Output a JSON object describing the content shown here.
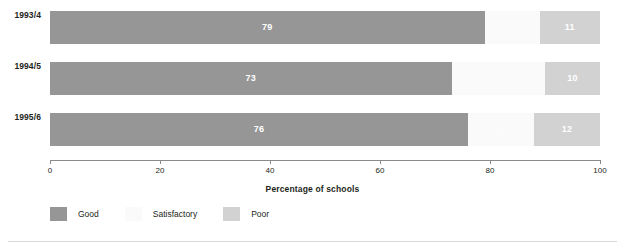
{
  "chart_data": {
    "type": "bar",
    "orientation": "horizontal",
    "stacked": true,
    "title": "",
    "xlabel": "Percentage of schools",
    "ylabel": "",
    "categories": [
      "1993/4",
      "1994/5",
      "1995/6"
    ],
    "series": [
      {
        "name": "Good",
        "color": "#969696",
        "values": [
          79,
          73,
          76
        ]
      },
      {
        "name": "Satisfactory",
        "color": "#fafafa",
        "values": [
          10,
          17,
          12
        ]
      },
      {
        "name": "Poor",
        "color": "#d2d2d2",
        "values": [
          11,
          10,
          12
        ]
      }
    ],
    "xlim": [
      0,
      100
    ],
    "xticks": [
      0,
      20,
      40,
      60,
      80,
      100
    ],
    "xtick_labels": [
      "0",
      "20",
      "40",
      "60",
      "80",
      "100"
    ],
    "grid": false,
    "legend_position": "bottom-left",
    "data_labels": true
  },
  "axis": {
    "title": "Percentage of schools",
    "ticks": [
      "0",
      "20",
      "40",
      "60",
      "80",
      "100"
    ]
  },
  "legend": {
    "items": [
      {
        "label": "Good",
        "color": "#969696"
      },
      {
        "label": "Satisfactory",
        "color": "#fafafa"
      },
      {
        "label": "Poor",
        "color": "#d2d2d2"
      }
    ]
  },
  "rows": [
    {
      "category": "1993/4",
      "segments": [
        {
          "label": "Good",
          "value": "79",
          "pct": 79,
          "color": "#969696"
        },
        {
          "label": "Satisfactory",
          "value": "10",
          "pct": 10,
          "color": "#fafafa"
        },
        {
          "label": "Poor",
          "value": "11",
          "pct": 11,
          "color": "#d2d2d2"
        }
      ]
    },
    {
      "category": "1994/5",
      "segments": [
        {
          "label": "Good",
          "value": "73",
          "pct": 73,
          "color": "#969696"
        },
        {
          "label": "Satisfactory",
          "value": "17",
          "pct": 17,
          "color": "#fafafa"
        },
        {
          "label": "Poor",
          "value": "10",
          "pct": 10,
          "color": "#d2d2d2"
        }
      ]
    },
    {
      "category": "1995/6",
      "segments": [
        {
          "label": "Good",
          "value": "76",
          "pct": 76,
          "color": "#969696"
        },
        {
          "label": "Satisfactory",
          "value": "12",
          "pct": 12,
          "color": "#fafafa"
        },
        {
          "label": "Poor",
          "value": "12",
          "pct": 12,
          "color": "#d2d2d2"
        }
      ]
    }
  ]
}
